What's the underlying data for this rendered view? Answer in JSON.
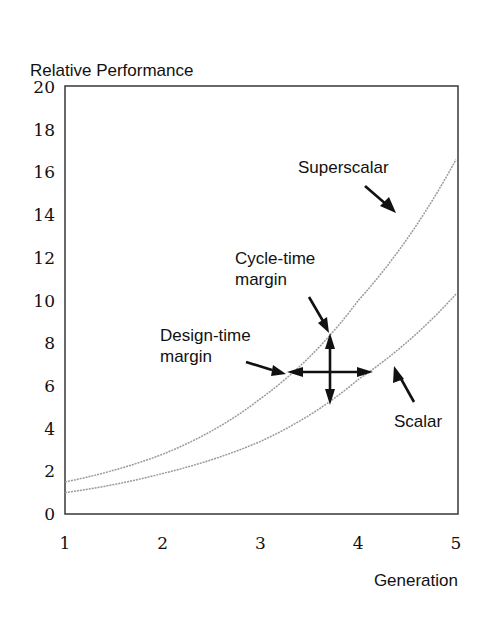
{
  "chart_data": {
    "type": "line",
    "title": "",
    "ylabel": "Relative Performance",
    "xlabel": "Generation",
    "x": [
      1,
      2,
      3,
      4,
      5
    ],
    "xlim": [
      1,
      5
    ],
    "ylim": [
      0,
      20
    ],
    "x_ticks": [
      "1",
      "2",
      "3",
      "4",
      "5"
    ],
    "y_ticks": [
      "0",
      "2",
      "4",
      "6",
      "8",
      "10",
      "12",
      "14",
      "16",
      "18",
      "20"
    ],
    "grid": false,
    "legend": "none (inline annotations)",
    "series": [
      {
        "name": "Superscalar",
        "values": [
          1.5,
          2.8,
          5.4,
          10.0,
          16.6
        ]
      },
      {
        "name": "Scalar",
        "values": [
          1.0,
          1.9,
          3.4,
          6.3,
          10.3
        ]
      }
    ],
    "annotations": [
      {
        "text": "Superscalar",
        "points_to": "Superscalar curve near generation 4.5"
      },
      {
        "text": "Scalar",
        "points_to": "Scalar curve near generation 4.4"
      },
      {
        "text": "Cycle-time margin",
        "description": "vertical double arrow at generation ~3.7 spanning Scalar (~5.2) to Superscalar (~8.5)"
      },
      {
        "text": "Design-time margin",
        "description": "horizontal double arrow at performance ~6.6 spanning Superscalar (~gen 3.3) to Scalar (~gen 4.15)"
      }
    ]
  },
  "labels": {
    "ylabel": "Relative Performance",
    "xlabel": "Generation",
    "superscalar": "Superscalar",
    "scalar": "Scalar",
    "cycle_time_line1": "Cycle-time",
    "cycle_time_line2": "margin",
    "design_time_line1": "Design-time",
    "design_time_line2": "margin"
  }
}
